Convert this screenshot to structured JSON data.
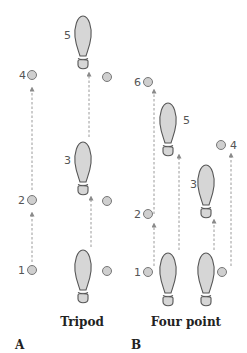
{
  "diagram": {
    "panels": [
      {
        "letter": "A",
        "caption": "Tripod",
        "labels": {
          "c4": "4",
          "c2": "2",
          "c1": "1",
          "f5": "5",
          "f3": "3"
        }
      },
      {
        "letter": "B",
        "caption": "Four point",
        "labels": {
          "c6": "6",
          "c2": "2",
          "c1": "1",
          "c4": "4",
          "f5": "5",
          "f3": "3"
        }
      }
    ],
    "colors": {
      "foot_fill": "#d6d6d6",
      "foot_stroke": "#555555",
      "circle_fill": "#cfcfcf",
      "dash": "#9a9a9a"
    }
  }
}
